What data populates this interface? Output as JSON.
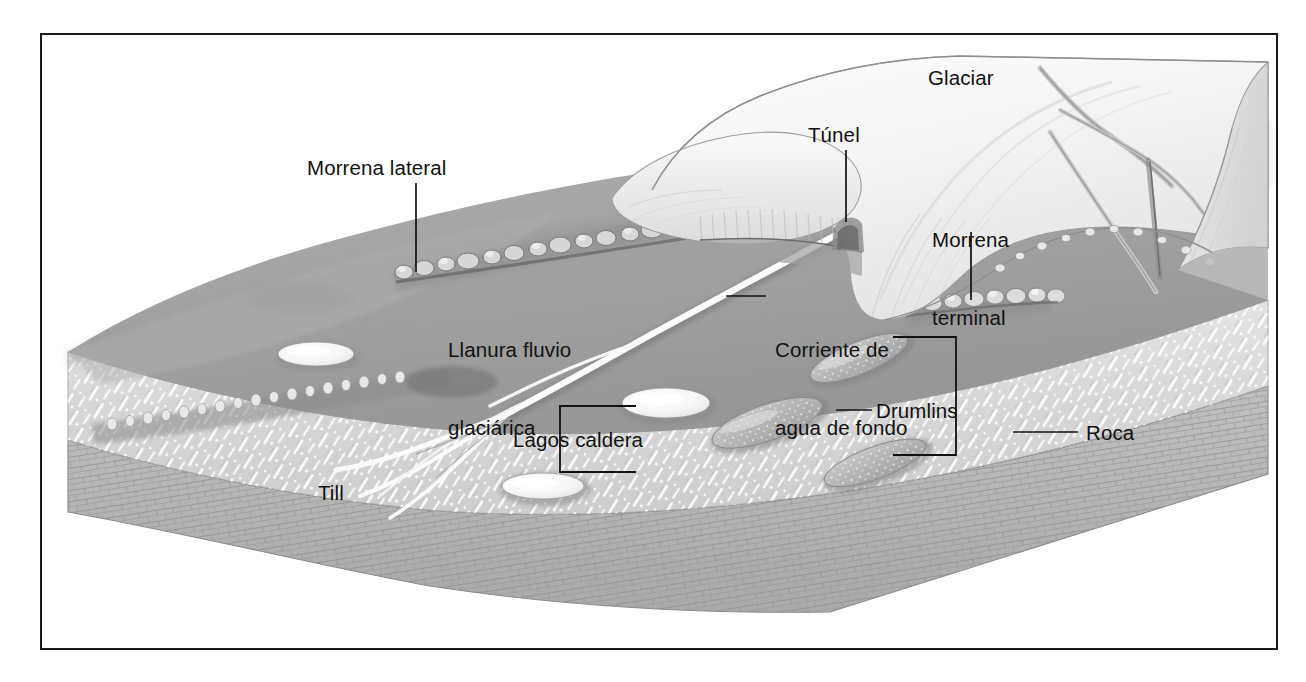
{
  "figure": {
    "language": "es",
    "border_color": "#1b1b1b",
    "background_color": "#ffffff"
  },
  "palette": {
    "outwash_plain": "#a6a6a6",
    "outwash_plain_dark": "#8d8d8d",
    "till_layer": "#d8d8d8",
    "bedrock_layer": "#b5b5b5",
    "glacier_ice": "#f2f2f2",
    "glacier_shadow": "#cfcfcf",
    "meltwater_white": "#fbfbfb",
    "label_text": "#111111",
    "leader_line": "#111111"
  },
  "labels": [
    {
      "id": "morrena-lateral",
      "text": "Morrena lateral",
      "lines": [
        "Morrena lateral"
      ],
      "x": 307,
      "y": 155,
      "leader": {
        "type": "line",
        "x1": 416,
        "y1": 183,
        "x2": 416,
        "y2": 270
      }
    },
    {
      "id": "glaciar",
      "text": "Glaciar",
      "lines": [
        "Glaciar"
      ],
      "x": 928,
      "y": 65,
      "leader": null
    },
    {
      "id": "tunel",
      "text": "Túnel",
      "lines": [
        "Túnel"
      ],
      "x": 808,
      "y": 122,
      "leader": {
        "type": "line",
        "x1": 846,
        "y1": 150,
        "x2": 846,
        "y2": 218
      }
    },
    {
      "id": "morrena-terminal",
      "text": "Morrena terminal",
      "lines": [
        "Morrena",
        "terminal"
      ],
      "x": 932,
      "y": 175,
      "leader": {
        "type": "line",
        "x1": 971,
        "y1": 230,
        "x2": 971,
        "y2": 290
      }
    },
    {
      "id": "llanura-fluvio-glaciarica",
      "text": "Llanura fluvio glaciárica",
      "lines": [
        "Llanura fluvio",
        "glaciárica"
      ],
      "x": 448,
      "y": 285,
      "leader": null
    },
    {
      "id": "corriente-de-agua-de-fondo",
      "text": "Corriente de agua de fondo",
      "lines": [
        "Corriente de",
        "agua de fondo"
      ],
      "x": 578,
      "y": 285,
      "leader": {
        "type": "line",
        "x1": 532,
        "y1": 295,
        "x2": 570,
        "y2": 295
      }
    },
    {
      "id": "drumlins",
      "text": "Drumlins",
      "lines": [
        "Drumlins"
      ],
      "x": 876,
      "y": 400,
      "leader": {
        "type": "line",
        "x1": 836,
        "y1": 410,
        "x2": 870,
        "y2": 410
      },
      "bracket": {
        "x": 956,
        "y_top": 337,
        "y_bottom": 455,
        "arm": 62,
        "side": "right"
      }
    },
    {
      "id": "lagos-caldera",
      "text": "Lagos caldera",
      "lines": [
        "Lagos caldera"
      ],
      "x": 513,
      "y": 434,
      "leader": null,
      "bracket": {
        "x": 560,
        "y_top": 406,
        "y_bottom": 472,
        "arm": 76,
        "side": "left"
      }
    },
    {
      "id": "roca",
      "text": "Roca",
      "lines": [
        "Roca"
      ],
      "x": 1086,
      "y": 422,
      "leader": {
        "type": "line",
        "x1": 1013,
        "y1": 432,
        "x2": 1078,
        "y2": 432
      }
    },
    {
      "id": "till",
      "text": "Till",
      "lines": [
        "Till"
      ],
      "x": 318,
      "y": 487,
      "leader": null
    }
  ],
  "features": {
    "glacier": {
      "name": "Glaciar",
      "description": "masa de hielo blanca con grietas"
    },
    "tunnel": {
      "name": "Túnel",
      "description": "túnel subglacial en el frente del hielo"
    },
    "terminal_moraine": {
      "name": "Morrena terminal",
      "description": "cordón de bloques al pie del glaciar"
    },
    "lateral_moraine": {
      "name": "Morrena lateral",
      "description": "cordón de bloques en la cresta lateral"
    },
    "outwash_plain": {
      "name": "Llanura fluvio glaciárica",
      "description": "planicie de lavado"
    },
    "meltwater_stream": {
      "name": "Corriente de agua de fondo",
      "description": "cauce trenzado de agua de fusión"
    },
    "drumlins": {
      "name": "Drumlins",
      "count": 3,
      "description": "colinas alargadas de till"
    },
    "kettle_lakes": {
      "name": "Lagos caldera",
      "count": 3,
      "description": "lagos en depresiones de hielo muerto"
    },
    "till": {
      "name": "Till",
      "description": "depósito glaciar no estratificado"
    },
    "bedrock": {
      "name": "Roca",
      "description": "sustrato rocoso estratificado"
    }
  }
}
